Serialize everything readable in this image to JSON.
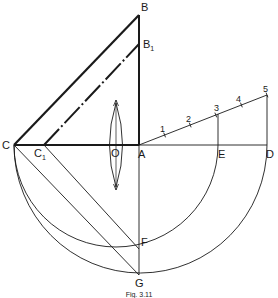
{
  "figure": {
    "caption": "Fig. 3.11",
    "colors": {
      "ink": "#1a1a1a",
      "background": "#ffffff"
    },
    "points": {
      "B": {
        "label": "B"
      },
      "B1": {
        "label": "B",
        "subscript": "1"
      },
      "C": {
        "label": "C"
      },
      "C1": {
        "label": "C",
        "subscript": "1"
      },
      "O": {
        "label": "O"
      },
      "A": {
        "label": "A"
      },
      "E": {
        "label": "E"
      },
      "D": {
        "label": "D"
      },
      "F": {
        "label": "F"
      },
      "G": {
        "label": "G"
      }
    },
    "division_marks": [
      "1",
      "2",
      "3",
      "4",
      "5"
    ],
    "elements": [
      "triangle ABC (thick)",
      "dash-dot line C1B1 parallel to CB",
      "lens at O on axis CA",
      "inclined line from A divided into 5 equal parts",
      "perpendiculars 3-E and 5-D",
      "semicircles on CE and CD",
      "lines C1F and CG"
    ]
  }
}
